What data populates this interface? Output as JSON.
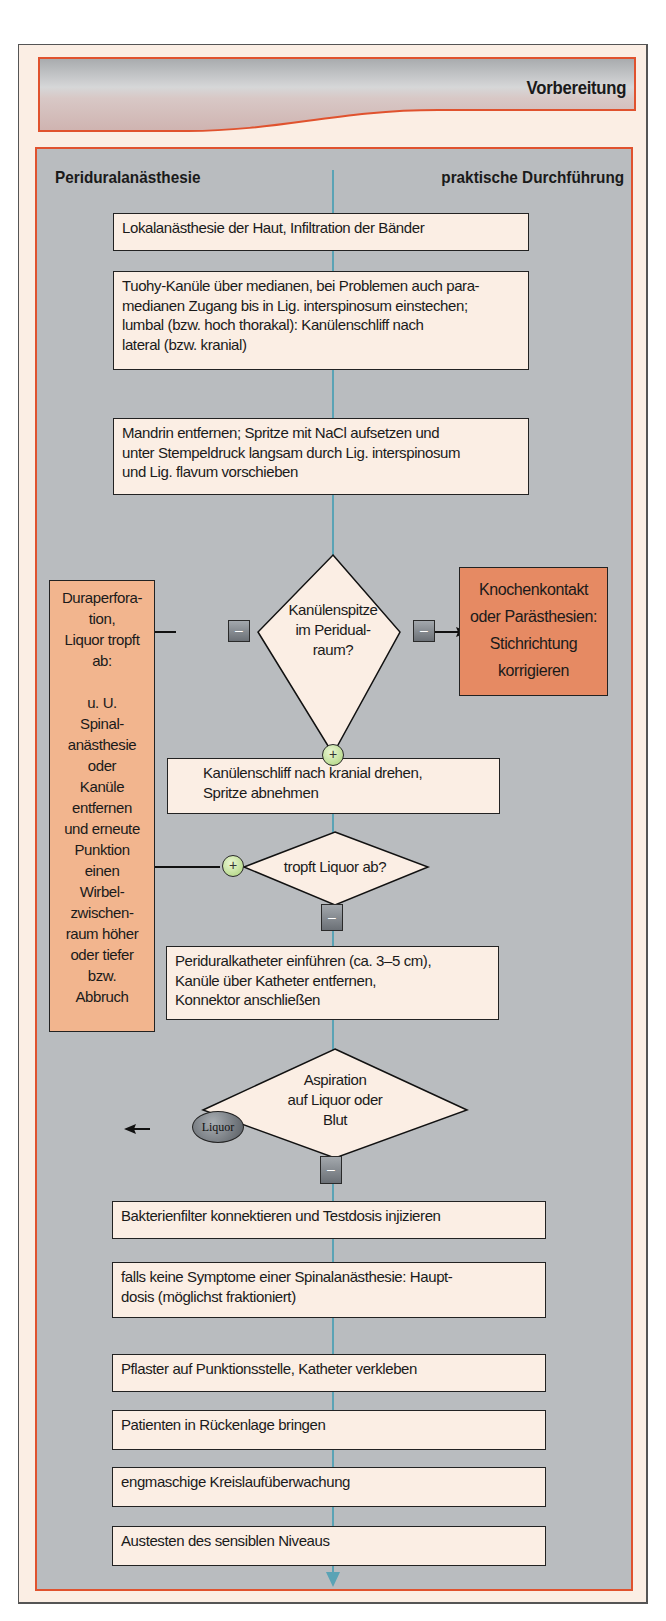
{
  "header": {
    "title": "Vorbereitung"
  },
  "panel": {
    "title_left": "Periduralanästhesie",
    "title_right": "praktische Durchführung"
  },
  "steps": [
    {
      "lines": [
        "Lokalanästhesie der Haut, Infiltration der Bänder"
      ]
    },
    {
      "lines": [
        "Tuohy-Kanüle über medianen, bei Problemen auch para-",
        "medianen Zugang bis in Lig. interspinosum einstechen;",
        "lumbal (bzw. hoch thorakal): Kanülenschliff nach",
        "lateral (bzw. kranial)"
      ]
    },
    {
      "lines": [
        "Mandrin entfernen; Spritze mit NaCl aufsetzen und",
        "unter Stempeldruck langsam durch Lig. interspinosum",
        "und Lig. flavum vorschieben"
      ]
    },
    {
      "lines": [
        "Kanülenschliff nach kranial drehen,",
        "Spritze abnehmen"
      ]
    },
    {
      "lines": [
        "Periduralkatheter einführen (ca. 3–5 cm),",
        "Kanüle über Katheter entfernen,",
        "Konnektor anschließen"
      ]
    },
    {
      "lines": [
        "Bakterienfilter konnektieren und Testdosis injizieren"
      ]
    },
    {
      "lines": [
        "falls keine Symptome einer Spinalanästhesie: Haupt-",
        "dosis (möglichst fraktioniert)"
      ]
    },
    {
      "lines": [
        "Pflaster auf Punktionsstelle, Katheter verkleben"
      ]
    },
    {
      "lines": [
        "Patienten in Rückenlage bringen"
      ]
    },
    {
      "lines": [
        "engmaschige Kreislaufüberwachung"
      ]
    },
    {
      "lines": [
        "Austesten des sensiblen Niveaus"
      ]
    }
  ],
  "decisions": [
    {
      "lines": [
        "Kanülenspitze",
        "im Peridual-",
        "raum?"
      ],
      "no_left": "–",
      "no_right": "–",
      "yes_down": "+"
    },
    {
      "lines": [
        "tropft Liquor ab?"
      ],
      "yes_left": "+",
      "no_down": "–"
    },
    {
      "lines": [
        "Aspiration",
        "auf Liquor oder",
        "Blut"
      ],
      "liquor_left": "Liquor",
      "no_down": "–"
    }
  ],
  "side_left": {
    "lines": [
      "Duraperfora-",
      "tion,",
      "Liquor tropft",
      "ab:",
      "",
      "u. U.",
      "Spinal-",
      "anästhesie",
      "oder",
      "Kanüle",
      "entfernen",
      "und erneute",
      "Punktion",
      "einen",
      "Wirbel-",
      "zwischen-",
      "raum höher",
      "oder tiefer",
      "bzw.",
      "Abbruch"
    ]
  },
  "side_right": {
    "lines": [
      "Knochenkontakt",
      "oder Parästhesien:",
      "Stichrichtung",
      "korrigieren"
    ]
  },
  "colors": {
    "frame_accent": "#e0522e",
    "panel_bg": "#b9bcbf",
    "box_bg": "#fbeee4",
    "side_left_bg": "#f2b58e",
    "side_right_bg": "#e68a63",
    "flow_line": "#5aa3b5"
  }
}
